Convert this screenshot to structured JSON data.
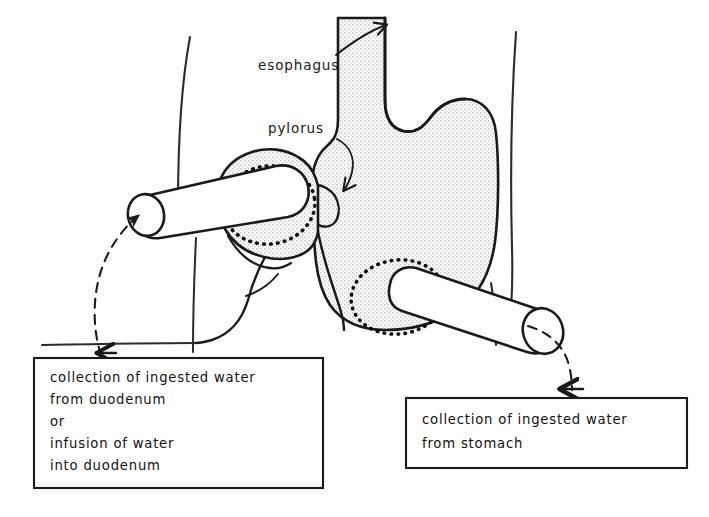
{
  "figure": {
    "background_color": "#ffffff",
    "ink_color": "#1a1a1a",
    "organ_fill_color": "#e9e9e9",
    "cannula_fill_color": "#ffffff"
  },
  "annotations": {
    "esophagus": {
      "label": "esophagus",
      "x": 258,
      "y": 70,
      "arrow": "curved-arrow-up-right"
    },
    "pylorus": {
      "label": "pylorus",
      "x": 268,
      "y": 133,
      "arrow": "curved-arrow-down-right"
    }
  },
  "callout_boxes": [
    {
      "id": "duodenal-cannula-box",
      "name": "duodenum-callout-box",
      "x": 34,
      "y": 358,
      "width": 289,
      "height": 130,
      "lines": [
        "collection of ingested water",
        "from duodenum",
        "or",
        "infusion  of water",
        "into duodenum"
      ],
      "connector": "dashed-curve-with-arrowhead"
    },
    {
      "id": "gastric-cannula-box",
      "name": "stomach-callout-box",
      "x": 406,
      "y": 398,
      "width": 281,
      "height": 70,
      "lines": [
        "collection of ingested water",
        "from stomach"
      ],
      "connector": "dashed-curve-with-arrowhead"
    }
  ],
  "anatomy_parts": [
    {
      "name": "stomach-body",
      "fill": "stippled"
    },
    {
      "name": "esophagus",
      "fill": "stippled"
    },
    {
      "name": "duodenum-loop",
      "fill": "stippled"
    },
    {
      "name": "pyloric-sphincter",
      "fill": "stippled"
    },
    {
      "name": "duodenal-cannula",
      "fill": "white"
    },
    {
      "name": "gastric-cannula",
      "fill": "white"
    },
    {
      "name": "duodenal-purse-string-suture",
      "fill": "dotted"
    },
    {
      "name": "gastric-purse-string-suture",
      "fill": "dotted"
    },
    {
      "name": "body-wall-outline-left",
      "fill": "none"
    },
    {
      "name": "body-wall-outline-right",
      "fill": "none"
    }
  ]
}
